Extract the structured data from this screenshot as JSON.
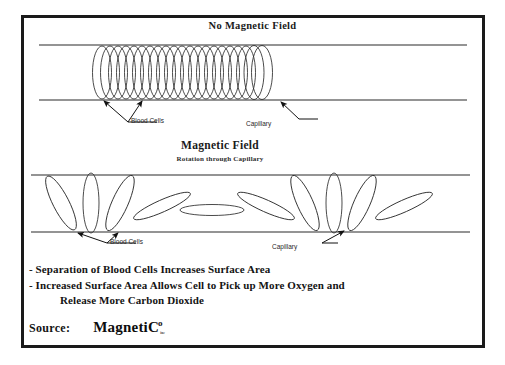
{
  "document": {
    "frame_color": "#1a1a1a",
    "background": "#ffffff"
  },
  "panels": {
    "top": {
      "title": "No Magnetic Field",
      "labels": {
        "blood_cells": "Blood Cells",
        "capillary": "Capillary"
      }
    },
    "bottom": {
      "title": "Magnetic Field",
      "subtitle": "Rotation through Capillary",
      "labels": {
        "blood_cells": "Blood Cells",
        "capillary": "Capillary"
      }
    }
  },
  "bullets": {
    "line1": "- Separation of Blood Cells Increases Surface Area",
    "line2": "- Increased Surface Area Allows Cell to Pick up More Oxygen and",
    "line2_cont": "Release More Carbon Dioxide"
  },
  "source": {
    "label": "Source:",
    "logo_main": "MagnetiC",
    "logo_superscript": "o",
    "logo_subscript": "inc"
  },
  "icons": {
    "arrow": "arrow-icon",
    "leader_line": "leader-line-icon"
  }
}
